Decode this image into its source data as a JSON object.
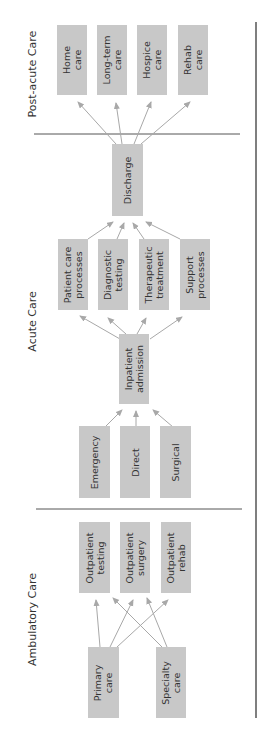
{
  "sections": {
    "post_acute": "Post-acute Care",
    "acute": "Acute Care",
    "ambulatory": "Ambulatory Care"
  },
  "post_acute_boxes": [
    {
      "label": "Home\ncare"
    },
    {
      "label": "Long-term\ncare"
    },
    {
      "label": "Hospice\ncare"
    },
    {
      "label": "Rehab\ncare"
    }
  ],
  "discharge": {
    "label": "Discharge"
  },
  "acute_processes": [
    {
      "label": "Patient care\nprocesses"
    },
    {
      "label": "Diagnostic\ntesting"
    },
    {
      "label": "Therapeutic\ntreatment"
    },
    {
      "label": "Support\nprocesses"
    }
  ],
  "inpatient_admission": {
    "label": "Inpatient\nadmission"
  },
  "admission_sources": [
    {
      "label": "Emergency"
    },
    {
      "label": "Direct"
    },
    {
      "label": "Surgical"
    }
  ],
  "outpatient_services": [
    {
      "label": "Outpatient\ntesting"
    },
    {
      "label": "Outpatient\nsurgery"
    },
    {
      "label": "Outpatient\nrehab"
    }
  ],
  "ambulatory_sources": [
    {
      "label": "Primary\ncare"
    },
    {
      "label": "Specialty\ncare"
    }
  ],
  "colors": {
    "box": "#c8c8c8",
    "arrow": "#a8a8a8",
    "divider": "#555555"
  }
}
